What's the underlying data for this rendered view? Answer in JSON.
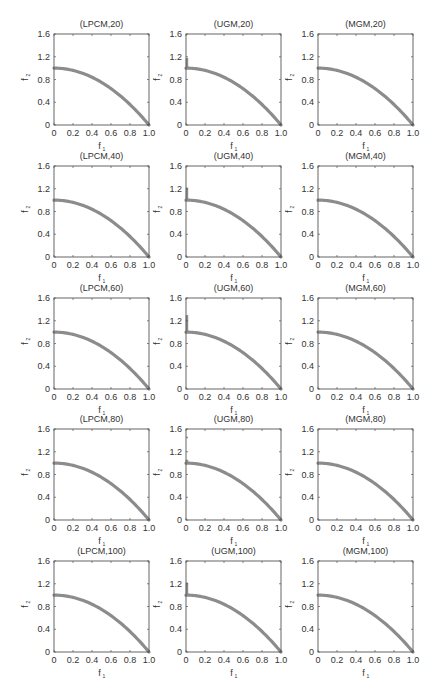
{
  "figure": {
    "layout": {
      "rows": 5,
      "cols": 3
    },
    "curve_color": "#8c8c8c",
    "axis_color": "#555555"
  },
  "chart_data": [
    {
      "type": "scatter",
      "title": "(LPCM,20)",
      "xlabel": "f1",
      "ylabel": "f2",
      "xlim": [
        0,
        1.0
      ],
      "ylim": [
        0,
        1.6
      ],
      "xticks": [
        "0",
        "0.2",
        "0.4",
        "0.6",
        "0.8",
        "1.0"
      ],
      "yticks": [
        "0",
        "0.4",
        "0.8",
        "1.2",
        "1.6"
      ],
      "series": [
        {
          "name": "Pareto front",
          "relation": "f2 = 1 - f1^2",
          "x": [
            0,
            0.1,
            0.2,
            0.3,
            0.4,
            0.5,
            0.6,
            0.7,
            0.8,
            0.9,
            1.0
          ],
          "y": [
            1.0,
            0.99,
            0.96,
            0.91,
            0.84,
            0.75,
            0.64,
            0.51,
            0.36,
            0.19,
            0.0
          ]
        }
      ],
      "extra_points": []
    },
    {
      "type": "scatter",
      "title": "(UGM,20)",
      "xlabel": "f1",
      "ylabel": "f2",
      "xlim": [
        0,
        1.0
      ],
      "ylim": [
        0,
        1.6
      ],
      "xticks": [
        "0",
        "0.2",
        "0.4",
        "0.6",
        "0.8",
        "1.0"
      ],
      "yticks": [
        "0",
        "0.4",
        "0.8",
        "1.2",
        "1.6"
      ],
      "series": [
        {
          "name": "Pareto front",
          "relation": "f2 = 1 - f1^2",
          "x": [
            0,
            0.1,
            0.2,
            0.3,
            0.4,
            0.5,
            0.6,
            0.7,
            0.8,
            0.9,
            1.0
          ],
          "y": [
            1.0,
            0.99,
            0.96,
            0.91,
            0.84,
            0.75,
            0.64,
            0.51,
            0.36,
            0.19,
            0.0
          ]
        }
      ],
      "extra_points": [
        {
          "x": 0,
          "y_from": 1.0,
          "y_to": 1.18
        }
      ]
    },
    {
      "type": "scatter",
      "title": "(MGM,20)",
      "xlabel": "f1",
      "ylabel": "f2",
      "xlim": [
        0,
        1.0
      ],
      "ylim": [
        0,
        1.6
      ],
      "xticks": [
        "0",
        "0.2",
        "0.4",
        "0.6",
        "0.8",
        "1.0"
      ],
      "yticks": [
        "0",
        "0.4",
        "0.8",
        "1.2",
        "1.6"
      ],
      "series": [
        {
          "name": "Pareto front",
          "relation": "f2 = 1 - f1^2",
          "x": [
            0,
            0.1,
            0.2,
            0.3,
            0.4,
            0.5,
            0.6,
            0.7,
            0.8,
            0.9,
            1.0
          ],
          "y": [
            1.0,
            0.99,
            0.96,
            0.91,
            0.84,
            0.75,
            0.64,
            0.51,
            0.36,
            0.19,
            0.0
          ]
        }
      ],
      "extra_points": []
    },
    {
      "type": "scatter",
      "title": "(LPCM,40)",
      "xlabel": "f1",
      "ylabel": "f2",
      "xlim": [
        0,
        1.0
      ],
      "ylim": [
        0,
        1.6
      ],
      "xticks": [
        "0",
        "0.2",
        "0.4",
        "0.6",
        "0.8",
        "1.0"
      ],
      "yticks": [
        "0",
        "0.4",
        "0.8",
        "1.2",
        "1.6"
      ],
      "series": [
        {
          "name": "Pareto front",
          "relation": "f2 = 1 - f1^2",
          "x": [
            0,
            0.1,
            0.2,
            0.3,
            0.4,
            0.5,
            0.6,
            0.7,
            0.8,
            0.9,
            1.0
          ],
          "y": [
            1.0,
            0.99,
            0.96,
            0.91,
            0.84,
            0.75,
            0.64,
            0.51,
            0.36,
            0.19,
            0.0
          ]
        }
      ],
      "extra_points": []
    },
    {
      "type": "scatter",
      "title": "(UGM,40)",
      "xlabel": "f1",
      "ylabel": "f2",
      "xlim": [
        0,
        1.0
      ],
      "ylim": [
        0,
        1.6
      ],
      "xticks": [
        "0",
        "0.2",
        "0.4",
        "0.6",
        "0.8",
        "1.0"
      ],
      "yticks": [
        "0",
        "0.4",
        "0.8",
        "1.2",
        "1.6"
      ],
      "series": [
        {
          "name": "Pareto front",
          "relation": "f2 = 1 - f1^2",
          "x": [
            0,
            0.1,
            0.2,
            0.3,
            0.4,
            0.5,
            0.6,
            0.7,
            0.8,
            0.9,
            1.0
          ],
          "y": [
            1.0,
            0.99,
            0.96,
            0.91,
            0.84,
            0.75,
            0.64,
            0.51,
            0.36,
            0.19,
            0.0
          ]
        }
      ],
      "extra_points": [
        {
          "x": 0,
          "y_from": 1.0,
          "y_to": 1.22
        }
      ]
    },
    {
      "type": "scatter",
      "title": "(MGM,40)",
      "xlabel": "f1",
      "ylabel": "f2",
      "xlim": [
        0,
        1.0
      ],
      "ylim": [
        0,
        1.6
      ],
      "xticks": [
        "0",
        "0.2",
        "0.4",
        "0.6",
        "0.8",
        "1.0"
      ],
      "yticks": [
        "0",
        "0.4",
        "0.8",
        "1.2",
        "1.6"
      ],
      "series": [
        {
          "name": "Pareto front",
          "relation": "f2 = 1 - f1^2",
          "x": [
            0,
            0.1,
            0.2,
            0.3,
            0.4,
            0.5,
            0.6,
            0.7,
            0.8,
            0.9,
            1.0
          ],
          "y": [
            1.0,
            0.99,
            0.96,
            0.91,
            0.84,
            0.75,
            0.64,
            0.51,
            0.36,
            0.19,
            0.0
          ]
        }
      ],
      "extra_points": []
    },
    {
      "type": "scatter",
      "title": "(LPCM,60)",
      "xlabel": "f1",
      "ylabel": "f2",
      "xlim": [
        0,
        1.0
      ],
      "ylim": [
        0,
        1.6
      ],
      "xticks": [
        "0",
        "0.2",
        "0.4",
        "0.6",
        "0.8",
        "1.0"
      ],
      "yticks": [
        "0",
        "0.4",
        "0.8",
        "1.2",
        "1.6"
      ],
      "series": [
        {
          "name": "Pareto front",
          "relation": "f2 = 1 - f1^2",
          "x": [
            0,
            0.1,
            0.2,
            0.3,
            0.4,
            0.5,
            0.6,
            0.7,
            0.8,
            0.9,
            1.0
          ],
          "y": [
            1.0,
            0.99,
            0.96,
            0.91,
            0.84,
            0.75,
            0.64,
            0.51,
            0.36,
            0.19,
            0.0
          ]
        }
      ],
      "extra_points": []
    },
    {
      "type": "scatter",
      "title": "(UGM,60)",
      "xlabel": "f1",
      "ylabel": "f2",
      "xlim": [
        0,
        1.0
      ],
      "ylim": [
        0,
        1.6
      ],
      "xticks": [
        "0",
        "0.2",
        "0.4",
        "0.6",
        "0.8",
        "1.0"
      ],
      "yticks": [
        "0",
        "0.4",
        "0.8",
        "1.2",
        "1.6"
      ],
      "series": [
        {
          "name": "Pareto front",
          "relation": "f2 = 1 - f1^2",
          "x": [
            0,
            0.1,
            0.2,
            0.3,
            0.4,
            0.5,
            0.6,
            0.7,
            0.8,
            0.9,
            1.0
          ],
          "y": [
            1.0,
            0.99,
            0.96,
            0.91,
            0.84,
            0.75,
            0.64,
            0.51,
            0.36,
            0.19,
            0.0
          ]
        }
      ],
      "extra_points": [
        {
          "x": 0,
          "y_from": 1.0,
          "y_to": 1.3
        }
      ]
    },
    {
      "type": "scatter",
      "title": "(MGM,60)",
      "xlabel": "f1",
      "ylabel": "f2",
      "xlim": [
        0,
        1.0
      ],
      "ylim": [
        0,
        1.6
      ],
      "xticks": [
        "0",
        "0.2",
        "0.4",
        "0.6",
        "0.8",
        "1.0"
      ],
      "yticks": [
        "0",
        "0.4",
        "0.8",
        "1.2",
        "1.6"
      ],
      "series": [
        {
          "name": "Pareto front",
          "relation": "f2 = 1 - f1^2",
          "x": [
            0,
            0.1,
            0.2,
            0.3,
            0.4,
            0.5,
            0.6,
            0.7,
            0.8,
            0.9,
            1.0
          ],
          "y": [
            1.0,
            0.99,
            0.96,
            0.91,
            0.84,
            0.75,
            0.64,
            0.51,
            0.36,
            0.19,
            0.0
          ]
        }
      ],
      "extra_points": []
    },
    {
      "type": "scatter",
      "title": "(LPCM,80)",
      "xlabel": "f1",
      "ylabel": "f2",
      "xlim": [
        0,
        1.0
      ],
      "ylim": [
        0,
        1.6
      ],
      "xticks": [
        "0",
        "0.2",
        "0.4",
        "0.6",
        "0.8",
        "1.0"
      ],
      "yticks": [
        "0",
        "0.4",
        "0.8",
        "1.2",
        "1.6"
      ],
      "series": [
        {
          "name": "Pareto front",
          "relation": "f2 = 1 - f1^2",
          "x": [
            0,
            0.1,
            0.2,
            0.3,
            0.4,
            0.5,
            0.6,
            0.7,
            0.8,
            0.9,
            1.0
          ],
          "y": [
            1.0,
            0.99,
            0.96,
            0.91,
            0.84,
            0.75,
            0.64,
            0.51,
            0.36,
            0.19,
            0.0
          ]
        }
      ],
      "extra_points": []
    },
    {
      "type": "scatter",
      "title": "(UGM,80)",
      "xlabel": "f1",
      "ylabel": "f2",
      "xlim": [
        0,
        1.0
      ],
      "ylim": [
        0,
        1.6
      ],
      "xticks": [
        "0",
        "0.2",
        "0.4",
        "0.6",
        "0.8",
        "1.0"
      ],
      "yticks": [
        "0",
        "0.4",
        "0.8",
        "1.2",
        "1.6"
      ],
      "series": [
        {
          "name": "Pareto front",
          "relation": "f2 = 1 - f1^2",
          "x": [
            0,
            0.1,
            0.2,
            0.3,
            0.4,
            0.5,
            0.6,
            0.7,
            0.8,
            0.9,
            1.0
          ],
          "y": [
            1.0,
            0.99,
            0.96,
            0.91,
            0.84,
            0.75,
            0.64,
            0.51,
            0.36,
            0.19,
            0.0
          ]
        }
      ],
      "extra_points": [
        {
          "x": 0,
          "y_from": 1.0,
          "y_to": 1.06
        },
        {
          "x": 0,
          "y": 1.45
        }
      ]
    },
    {
      "type": "scatter",
      "title": "(MGM,80)",
      "xlabel": "f1",
      "ylabel": "f2",
      "xlim": [
        0,
        1.0
      ],
      "ylim": [
        0,
        1.6
      ],
      "xticks": [
        "0",
        "0.2",
        "0.4",
        "0.6",
        "0.8",
        "1.0"
      ],
      "yticks": [
        "0",
        "0.4",
        "0.8",
        "1.2",
        "1.6"
      ],
      "series": [
        {
          "name": "Pareto front",
          "relation": "f2 = 1 - f1^2",
          "x": [
            0,
            0.1,
            0.2,
            0.3,
            0.4,
            0.5,
            0.6,
            0.7,
            0.8,
            0.9,
            1.0
          ],
          "y": [
            1.0,
            0.99,
            0.96,
            0.91,
            0.84,
            0.75,
            0.64,
            0.51,
            0.36,
            0.19,
            0.0
          ]
        }
      ],
      "extra_points": []
    },
    {
      "type": "scatter",
      "title": "(LPCM,100)",
      "xlabel": "f1",
      "ylabel": "f2",
      "xlim": [
        0,
        1.0
      ],
      "ylim": [
        0,
        1.6
      ],
      "xticks": [
        "0",
        "0.2",
        "0.4",
        "0.6",
        "0.8",
        "1.0"
      ],
      "yticks": [
        "0",
        "0.4",
        "0.8",
        "1.2",
        "1.6"
      ],
      "series": [
        {
          "name": "Pareto front",
          "relation": "f2 = 1 - f1^2",
          "x": [
            0,
            0.1,
            0.2,
            0.3,
            0.4,
            0.5,
            0.6,
            0.7,
            0.8,
            0.9,
            1.0
          ],
          "y": [
            1.0,
            0.99,
            0.96,
            0.91,
            0.84,
            0.75,
            0.64,
            0.51,
            0.36,
            0.19,
            0.0
          ]
        }
      ],
      "extra_points": []
    },
    {
      "type": "scatter",
      "title": "(UGM,100)",
      "xlabel": "f1",
      "ylabel": "f2",
      "xlim": [
        0,
        1.0
      ],
      "ylim": [
        0,
        1.6
      ],
      "xticks": [
        "0",
        "0.2",
        "0.4",
        "0.6",
        "0.8",
        "1.0"
      ],
      "yticks": [
        "0",
        "0.4",
        "0.8",
        "1.2",
        "1.6"
      ],
      "series": [
        {
          "name": "Pareto front",
          "relation": "f2 = 1 - f1^2",
          "x": [
            0,
            0.1,
            0.2,
            0.3,
            0.4,
            0.5,
            0.6,
            0.7,
            0.8,
            0.9,
            1.0
          ],
          "y": [
            1.0,
            0.99,
            0.96,
            0.91,
            0.84,
            0.75,
            0.64,
            0.51,
            0.36,
            0.19,
            0.0
          ]
        }
      ],
      "extra_points": [
        {
          "x": 0,
          "y_from": 1.0,
          "y_to": 1.22
        }
      ]
    },
    {
      "type": "scatter",
      "title": "(MGM,100)",
      "xlabel": "f1",
      "ylabel": "f2",
      "xlim": [
        0,
        1.0
      ],
      "ylim": [
        0,
        1.6
      ],
      "xticks": [
        "0",
        "0.2",
        "0.4",
        "0.6",
        "0.8",
        "1.0"
      ],
      "yticks": [
        "0",
        "0.4",
        "0.8",
        "1.2",
        "1.6"
      ],
      "series": [
        {
          "name": "Pareto front",
          "relation": "f2 = 1 - f1^2",
          "x": [
            0,
            0.1,
            0.2,
            0.3,
            0.4,
            0.5,
            0.6,
            0.7,
            0.8,
            0.9,
            1.0
          ],
          "y": [
            1.0,
            0.99,
            0.96,
            0.91,
            0.84,
            0.75,
            0.64,
            0.51,
            0.36,
            0.19,
            0.0
          ]
        }
      ],
      "extra_points": []
    }
  ],
  "caption": {
    "visible_text": ""
  }
}
